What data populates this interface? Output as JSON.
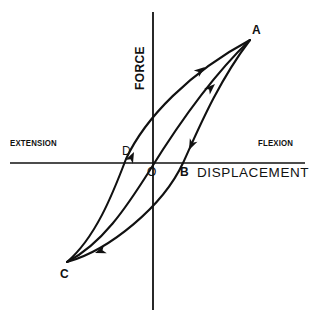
{
  "figure": {
    "name": "force-displacement-hysteresis-loop",
    "background_color": "#ffffff",
    "stroke_color": "#111111"
  },
  "axes": {
    "x_axis": {
      "title": "DISPLACEMENT",
      "left_label": "EXTENSION",
      "right_label": "FLEXION",
      "y_pixel": 163,
      "x_start": 10,
      "x_end": 305
    },
    "y_axis": {
      "title": "FORCE",
      "x_pixel": 153,
      "y_start": 12,
      "y_end": 310
    },
    "origin_label": "O"
  },
  "points": [
    {
      "id": "A",
      "label": "A",
      "x": 250,
      "y": 40,
      "label_x": 252,
      "label_y": 24
    },
    {
      "id": "B",
      "label": "B",
      "x": 183,
      "y": 163,
      "label_x": 180,
      "label_y": 166
    },
    {
      "id": "C",
      "label": "C",
      "x": 67,
      "y": 262,
      "label_x": 60,
      "label_y": 268
    },
    {
      "id": "D",
      "label": "D",
      "x": 126,
      "y": 159,
      "label_x": 122,
      "label_y": 145
    },
    {
      "id": "O",
      "label": "O",
      "x": 153,
      "y": 163,
      "label_x": 147,
      "label_y": 166
    }
  ],
  "chart_data": {
    "type": "line",
    "title": "",
    "xlabel": "DISPLACEMENT",
    "ylabel": "FORCE",
    "grid": false,
    "legend": "none",
    "quadrant_labels": {
      "left": "EXTENSION",
      "right": "FLEXION"
    },
    "curves": [
      {
        "name": "loading-upper",
        "from": "C",
        "to": "A",
        "direction": "up-right",
        "path": "M 67 262 C 95 238, 112 196, 126 159 C 145 118, 190 72, 250 40",
        "arrows": [
          {
            "x": 134,
            "y": 152,
            "angle": -64
          },
          {
            "x": 205,
            "y": 67,
            "angle": -38
          }
        ]
      },
      {
        "name": "loading-middle",
        "from": "C",
        "to": "A",
        "direction": "up-right",
        "path": "M 67 262 C 102 244, 126 208, 150 170 C 176 128, 210 78, 250 40",
        "arrows": [
          {
            "x": 215,
            "y": 84,
            "angle": -43
          }
        ]
      },
      {
        "name": "unloading-lower",
        "from": "A",
        "to": "C",
        "direction": "down-left",
        "path": "M 250 40 C 218 82, 198 130, 183 163 C 163 206, 110 250, 67 262",
        "arrows": [
          {
            "x": 189,
            "y": 150,
            "angle": 115
          },
          {
            "x": 95,
            "y": 253,
            "angle": 160
          }
        ]
      }
    ]
  }
}
